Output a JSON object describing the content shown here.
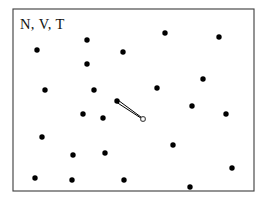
{
  "figure": {
    "name": "nvt-ensemble-schematic",
    "width": 265,
    "height": 207,
    "background_color": "#ffffff"
  },
  "label": {
    "text": "N, V, T",
    "x": 20,
    "y": 29,
    "font_size": 14.5,
    "color": "#111111"
  },
  "box": {
    "x": 13,
    "y": 9,
    "width": 241,
    "height": 182,
    "stroke_color": "#3b3b3b",
    "stroke_width": 1.1,
    "fill_color": "#ffffff"
  },
  "particles": {
    "color": "#000000",
    "radius": 2.7,
    "count": 25,
    "points": [
      {
        "x": 37,
        "y": 50
      },
      {
        "x": 87,
        "y": 40
      },
      {
        "x": 123,
        "y": 52
      },
      {
        "x": 87,
        "y": 64
      },
      {
        "x": 165,
        "y": 33
      },
      {
        "x": 219,
        "y": 37
      },
      {
        "x": 45,
        "y": 90
      },
      {
        "x": 94,
        "y": 90
      },
      {
        "x": 203,
        "y": 79
      },
      {
        "x": 157,
        "y": 88
      },
      {
        "x": 192,
        "y": 106
      },
      {
        "x": 226,
        "y": 114
      },
      {
        "x": 83,
        "y": 114
      },
      {
        "x": 103,
        "y": 118
      },
      {
        "x": 42,
        "y": 137
      },
      {
        "x": 173,
        "y": 145
      },
      {
        "x": 73,
        "y": 155
      },
      {
        "x": 105,
        "y": 153
      },
      {
        "x": 35,
        "y": 178
      },
      {
        "x": 72,
        "y": 180
      },
      {
        "x": 124,
        "y": 180
      },
      {
        "x": 232,
        "y": 168
      },
      {
        "x": 190,
        "y": 187
      },
      {
        "x": 117,
        "y": 101
      },
      {
        "x": 143,
        "y": 119
      }
    ]
  },
  "velocity_vector": {
    "name": "velocity-arrow",
    "tail": {
      "x": 117,
      "y": 101
    },
    "head": {
      "x": 143,
      "y": 119
    },
    "line_color": "#000000",
    "tail_width": 2.6,
    "head_width": 0.7,
    "marker_radius": 2.3,
    "marker_fill": "#ffffff",
    "marker_stroke": "#555555"
  },
  "chart_data": {
    "type": "scatter",
    "title": "N, V, T",
    "xlabel": "",
    "ylabel": "",
    "xlim": [
      13,
      254
    ],
    "ylim": [
      9,
      191
    ],
    "grid": false,
    "legend": "none",
    "annotations": [
      "N, V, T",
      "velocity vector from particle at (117,101) to (143,119)"
    ],
    "series": [
      {
        "name": "particles",
        "marker": "filled-circle",
        "color": "#000000",
        "x": [
          37,
          87,
          123,
          87,
          165,
          219,
          45,
          94,
          203,
          157,
          192,
          226,
          83,
          103,
          42,
          173,
          73,
          105,
          35,
          72,
          124,
          232,
          190,
          117
        ],
        "y": [
          50,
          40,
          52,
          64,
          33,
          37,
          90,
          90,
          79,
          88,
          106,
          114,
          114,
          118,
          137,
          145,
          155,
          153,
          178,
          180,
          180,
          168,
          187,
          101
        ]
      },
      {
        "name": "velocity-endpoint",
        "marker": "open-circle",
        "color": "#555555",
        "x": [
          143
        ],
        "y": [
          119
        ]
      }
    ]
  }
}
